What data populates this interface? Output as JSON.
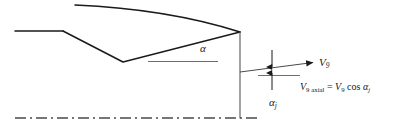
{
  "figure": {
    "type": "engineering-cross-section-diagram",
    "background_color": "#ffffff"
  },
  "colors": {
    "outline": "#1a1a1a",
    "reference_line": "#6e6e6e",
    "centerline": "#4a4a4a",
    "text": "#1a1a1a"
  },
  "labels": {
    "angle_alpha": {
      "symbol": "α",
      "name": "vane-turning-angle",
      "x": 200,
      "y": 43
    },
    "angle_alpha_j": {
      "symbol": "α",
      "subscript": "j",
      "name": "jet-deflection-angle",
      "x": 269,
      "y": 97
    },
    "velocity_v9": {
      "symbol": "V",
      "subscript": "9",
      "name": "station-9-velocity-vector",
      "x": 319,
      "y": 57
    }
  },
  "equation": {
    "text": "V9 axial = V9 cos αj",
    "lhs_symbol": "V",
    "lhs_subscript_station": "9",
    "lhs_subscript_word": "axial",
    "equals": "=",
    "rhs_symbol": "V",
    "rhs_subscript_station": "9",
    "rhs_function": "cos",
    "rhs_angle_symbol": "α",
    "rhs_angle_subscript": "j"
  },
  "geometry": {
    "upper_surface_curve": {
      "name": "vane-upper-camber-curve",
      "start": [
        75,
        5
      ],
      "control": [
        170,
        10
      ],
      "end": [
        240,
        32
      ]
    },
    "leading_horizontal": {
      "name": "inlet-wall-horizontal",
      "from": [
        15,
        31
      ],
      "to": [
        63,
        31
      ]
    },
    "lower_ramp_descending": {
      "name": "vane-lower-ramp-descending",
      "from": [
        63,
        31
      ],
      "to": [
        123,
        62
      ]
    },
    "lower_ramp_ascending": {
      "name": "vane-lower-ramp-ascending",
      "from": [
        123,
        62
      ],
      "to": [
        240,
        32
      ]
    },
    "trailing_edge_vertical": {
      "name": "trailing-edge-exit-plane",
      "from": [
        240,
        32
      ],
      "to": [
        240,
        118
      ]
    },
    "alpha_reference_line": {
      "name": "alpha-horizontal-reference",
      "from": [
        148,
        61
      ],
      "to": [
        218,
        61
      ]
    },
    "jet_flow_line": {
      "name": "jet-flow-direction-line",
      "from": [
        240,
        72
      ],
      "to": [
        318,
        62
      ]
    },
    "jet_reference_line": {
      "name": "jet-axial-reference-line",
      "from": [
        258,
        75
      ],
      "to": [
        300,
        75
      ]
    },
    "exit_height_arrow": {
      "name": "exit-area-height-double-arrow",
      "x": 272,
      "top": 50,
      "bottom": 90
    },
    "centerline": {
      "name": "engine-centerline",
      "from": [
        15,
        118
      ],
      "to": [
        258,
        118
      ],
      "style": "dash-dot"
    }
  }
}
